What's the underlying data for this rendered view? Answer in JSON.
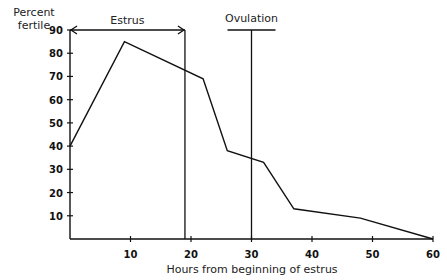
{
  "chart_data": {
    "type": "line",
    "title": "",
    "xlabel": "Hours from beginning of estrus",
    "ylabel": "Percent fertile",
    "xlim": [
      0,
      60
    ],
    "ylim": [
      0,
      90
    ],
    "x_ticks": [
      "10",
      "20",
      "30",
      "40",
      "50",
      "60"
    ],
    "y_ticks": [
      "10",
      "20",
      "30",
      "40",
      "50",
      "60",
      "70",
      "80",
      "90"
    ],
    "grid": false,
    "series": [
      {
        "name": "Percent fertile",
        "x": [
          0,
          9,
          22,
          26,
          32,
          37,
          48,
          60
        ],
        "y": [
          40,
          85,
          69,
          38,
          33,
          13,
          9,
          0
        ]
      }
    ],
    "annotations": [
      {
        "label": "Estrus",
        "type": "arrow-span",
        "x_start": 0,
        "x_end": 19,
        "y": 90
      },
      {
        "label": "Ovulation",
        "type": "vertical-line",
        "x": 30
      }
    ]
  }
}
